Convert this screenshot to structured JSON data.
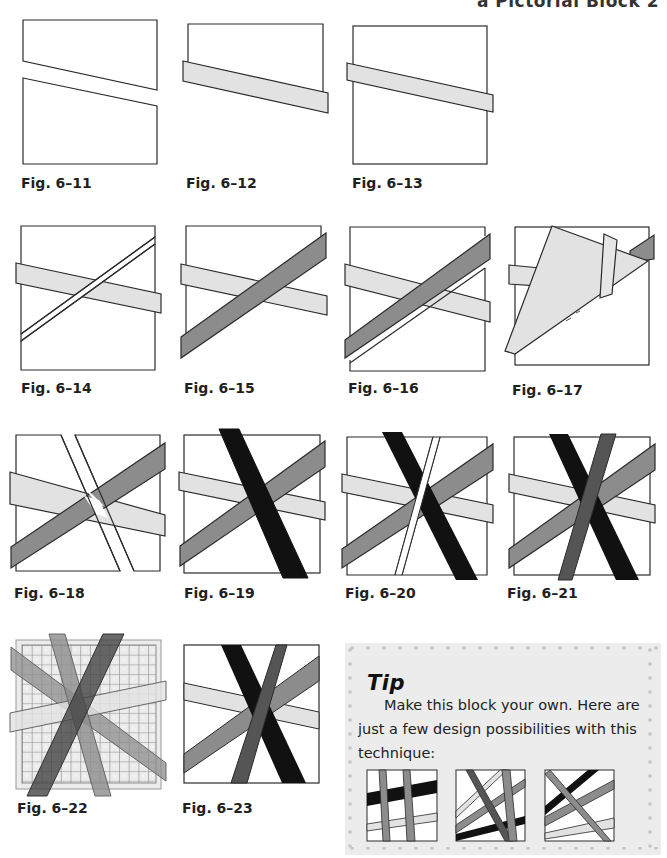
{
  "running_head": "a Pictorial Block 2",
  "colors": {
    "outline": "#2b2b2b",
    "light_strip": "#e2e2e2",
    "medium_strip": "#8c8c8c",
    "dark_strip": "#111111",
    "charcoal_strip": "#555555",
    "paper": "#ffffff",
    "template": "#ececec",
    "grid": "#8a8a8a",
    "tip_background": "#ececec",
    "tip_dots": "#c4c4c4"
  },
  "figures": [
    {
      "id": "6-11",
      "caption": "Fig. 6–11"
    },
    {
      "id": "6-12",
      "caption": "Fig. 6–12"
    },
    {
      "id": "6-13",
      "caption": "Fig. 6–13"
    },
    {
      "id": "6-14",
      "caption": "Fig. 6–14"
    },
    {
      "id": "6-15",
      "caption": "Fig. 6–15"
    },
    {
      "id": "6-16",
      "caption": "Fig. 6–16"
    },
    {
      "id": "6-17",
      "caption": "Fig. 6–17"
    },
    {
      "id": "6-18",
      "caption": "Fig. 6–18"
    },
    {
      "id": "6-19",
      "caption": "Fig. 6–19"
    },
    {
      "id": "6-20",
      "caption": "Fig. 6–20"
    },
    {
      "id": "6-21",
      "caption": "Fig. 6–21"
    },
    {
      "id": "6-22",
      "caption": "Fig. 6–22"
    },
    {
      "id": "6-23",
      "caption": "Fig. 6–23"
    }
  ],
  "tip": {
    "title": "Tip",
    "body": "Make this block your own. Here are just a few design possibilities with this technique:"
  }
}
